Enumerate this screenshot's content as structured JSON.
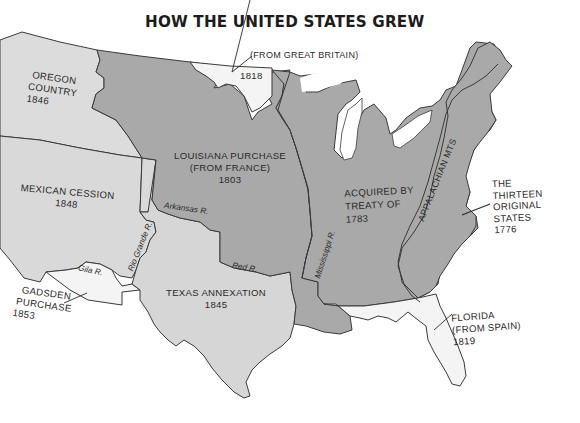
{
  "title": "HOW THE UNITED STATES GREW",
  "colors": {
    "original_territory": "#a9a9a9",
    "acquired_territory": "#d9d9d9",
    "light_acquisitions": "#f4f4f4",
    "border": "#3a3a3a",
    "background": "#ffffff"
  },
  "regions": [
    {
      "id": "oregon",
      "lines": [
        "OREGON",
        "COUNTRY",
        "1846"
      ]
    },
    {
      "id": "great-britain-1818",
      "lines": [
        "(FROM GREAT BRITAIN)",
        "1818"
      ]
    },
    {
      "id": "louisiana",
      "lines": [
        "LOUISIANA PURCHASE",
        "(FROM FRANCE)",
        "1803"
      ]
    },
    {
      "id": "mexican-cession",
      "lines": [
        "MEXICAN CESSION",
        "1848"
      ]
    },
    {
      "id": "treaty-1783",
      "lines": [
        "ACQUIRED BY",
        "TREATY OF",
        "1783"
      ]
    },
    {
      "id": "thirteen",
      "lines": [
        "THE",
        "THIRTEEN",
        "ORIGINAL",
        "STATES",
        "1776"
      ]
    },
    {
      "id": "texas",
      "lines": [
        "TEXAS ANNEXATION",
        "1845"
      ]
    },
    {
      "id": "gadsden",
      "lines": [
        "GADSDEN",
        "PURCHASE",
        "1853"
      ]
    },
    {
      "id": "florida",
      "lines": [
        "FLORIDA",
        "(FROM SPAIN)",
        "1819"
      ]
    }
  ],
  "features": {
    "mountains": "APPALACHIAN MTS",
    "rivers": [
      "Arkansas R.",
      "Red R.",
      "Rio Grande R.",
      "Gila R.",
      "Mississippi R."
    ]
  }
}
